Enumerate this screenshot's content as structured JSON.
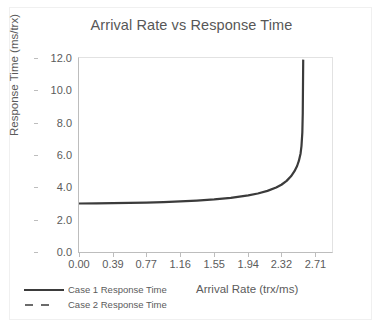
{
  "chart_data": {
    "type": "line",
    "title": "Arrival Rate vs Response Time",
    "xlabel": "Arrival Rate (trx/ms)",
    "ylabel": "Response Time (ms/trx)",
    "xlim": [
      0.0,
      2.9
    ],
    "ylim": [
      0.0,
      12.0
    ],
    "grid": false,
    "legend_position": "bottom-left",
    "x_ticks": [
      "0.00",
      "0.39",
      "0.77",
      "1.16",
      "1.55",
      "1.94",
      "2.32",
      "2.71"
    ],
    "x_tick_values": [
      0.0,
      0.39,
      0.77,
      1.16,
      1.55,
      1.94,
      2.32,
      2.71
    ],
    "y_ticks": [
      "0.0",
      "2.0",
      "4.0",
      "6.0",
      "8.0",
      "10.0",
      "12.0"
    ],
    "y_tick_values": [
      0.0,
      2.0,
      4.0,
      6.0,
      8.0,
      10.0,
      12.0
    ],
    "series": [
      {
        "name": "Case 1 Response Time",
        "style": "solid",
        "color": "#3b3b3b",
        "service_time": 3.0,
        "saturation_rate": 2.58,
        "x": [
          0.0,
          0.2,
          0.39,
          0.58,
          0.77,
          0.97,
          1.16,
          1.35,
          1.55,
          1.74,
          1.94,
          2.05,
          2.16,
          2.26,
          2.32,
          2.38,
          2.43,
          2.47,
          2.5,
          2.52,
          2.54,
          2.55,
          2.56,
          2.565,
          2.57
        ],
        "y": [
          3.0,
          3.01,
          3.02,
          3.04,
          3.06,
          3.09,
          3.13,
          3.18,
          3.25,
          3.35,
          3.5,
          3.62,
          3.78,
          3.99,
          4.16,
          4.4,
          4.68,
          5.0,
          5.32,
          5.63,
          6.1,
          6.55,
          7.4,
          8.6,
          11.9
        ]
      },
      {
        "name": "Case 2 Response Time",
        "style": "dashed",
        "color": "#6b6b6b",
        "x": [],
        "y": []
      }
    ]
  },
  "legend": {
    "items": [
      {
        "label": "Case 1 Response Time",
        "style": "solid"
      },
      {
        "label": "Case 2 Response Time",
        "style": "dashed"
      }
    ]
  }
}
